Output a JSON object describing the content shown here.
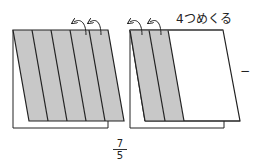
{
  "diagram": {
    "annotation": "4つめくる",
    "dash": "−",
    "fraction": {
      "numerator": "7",
      "denominator": "5"
    },
    "colors": {
      "shade": "#c8c8c8",
      "stroke": "#222222",
      "background": "#ffffff"
    },
    "left_figure": {
      "strips_total": 5,
      "strips_shaded": 5,
      "flip_arrows": 2
    },
    "right_figure": {
      "strips_total": 5,
      "strips_shaded": 2,
      "flip_arrows": 2
    }
  }
}
